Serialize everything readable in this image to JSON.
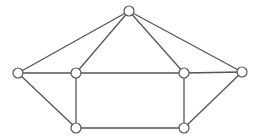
{
  "graph": {
    "title": "",
    "nodes": [
      {
        "id": "top",
        "label": ""
      },
      {
        "id": "left",
        "label": ""
      },
      {
        "id": "inner-left",
        "label": ""
      },
      {
        "id": "inner-right",
        "label": ""
      },
      {
        "id": "right",
        "label": ""
      },
      {
        "id": "bottom-left",
        "label": ""
      },
      {
        "id": "bottom-right",
        "label": ""
      }
    ],
    "edges": [
      [
        "top",
        "left"
      ],
      [
        "top",
        "inner-left"
      ],
      [
        "top",
        "inner-right"
      ],
      [
        "top",
        "right"
      ],
      [
        "left",
        "inner-left"
      ],
      [
        "inner-left",
        "inner-right"
      ],
      [
        "inner-right",
        "right"
      ],
      [
        "left",
        "bottom-left"
      ],
      [
        "inner-left",
        "bottom-left"
      ],
      [
        "inner-right",
        "bottom-right"
      ],
      [
        "right",
        "bottom-right"
      ],
      [
        "bottom-left",
        "bottom-right"
      ]
    ],
    "colors": {
      "stroke": "#555555",
      "node_fill": "#ffffff"
    }
  }
}
